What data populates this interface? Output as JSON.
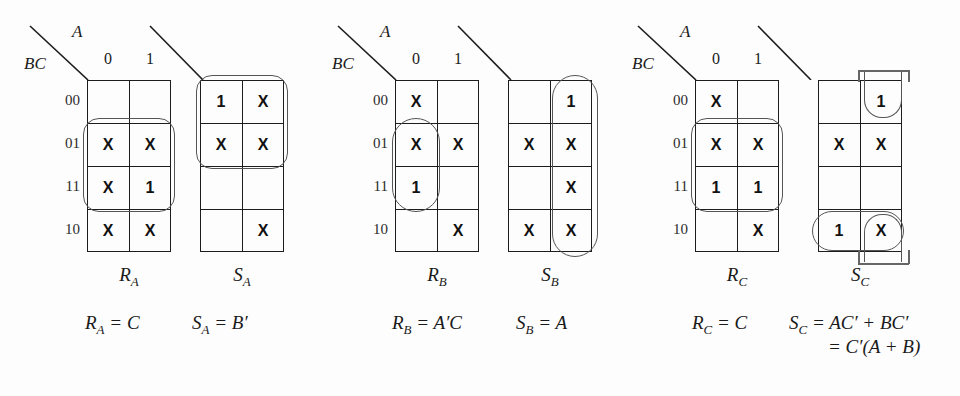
{
  "figure": {
    "background_color": "#fdfdfd",
    "line_color": "#1d1d1d",
    "group_color": "#555555"
  },
  "axis": {
    "col_var": "A",
    "row_var": "BC",
    "col_labels": [
      "0",
      "1"
    ],
    "row_labels": [
      "00",
      "01",
      "11",
      "10"
    ]
  },
  "maps": [
    {
      "id": "RA",
      "name": "R",
      "subscript": "A",
      "cells": [
        [
          "",
          ""
        ],
        [
          "X",
          "X"
        ],
        [
          "X",
          "1"
        ],
        [
          "X",
          "X"
        ]
      ],
      "groups": [
        {
          "kind": "oval",
          "rows": [
            1,
            2
          ],
          "cols": [
            0,
            1
          ]
        }
      ]
    },
    {
      "id": "SA",
      "name": "S",
      "subscript": "A",
      "cells": [
        [
          "1",
          "X"
        ],
        [
          "X",
          "X"
        ],
        [
          "",
          ""
        ],
        [
          "",
          "X"
        ]
      ],
      "groups": [
        {
          "kind": "oval",
          "rows": [
            0,
            1
          ],
          "cols": [
            0,
            1
          ]
        }
      ]
    },
    {
      "id": "RB",
      "name": "R",
      "subscript": "B",
      "cells": [
        [
          "X",
          ""
        ],
        [
          "X",
          "X"
        ],
        [
          "1",
          ""
        ],
        [
          "",
          "X"
        ]
      ],
      "groups": [
        {
          "kind": "oval",
          "rows": [
            1,
            2
          ],
          "cols": [
            0,
            0
          ]
        }
      ]
    },
    {
      "id": "SB",
      "name": "S",
      "subscript": "B",
      "cells": [
        [
          "",
          "1"
        ],
        [
          "X",
          "X"
        ],
        [
          "",
          "X"
        ],
        [
          "X",
          "X"
        ]
      ],
      "groups": [
        {
          "kind": "oval",
          "rows": [
            0,
            3
          ],
          "cols": [
            1,
            1
          ]
        }
      ]
    },
    {
      "id": "RC",
      "name": "R",
      "subscript": "C",
      "cells": [
        [
          "X",
          ""
        ],
        [
          "X",
          "X"
        ],
        [
          "1",
          "1"
        ],
        [
          "",
          "X"
        ]
      ],
      "groups": [
        {
          "kind": "oval",
          "rows": [
            1,
            2
          ],
          "cols": [
            0,
            1
          ]
        }
      ]
    },
    {
      "id": "SC",
      "name": "S",
      "subscript": "C",
      "cells": [
        [
          "",
          "1"
        ],
        [
          "X",
          "X"
        ],
        [
          "",
          ""
        ],
        [
          "1",
          "X"
        ]
      ],
      "groups": [
        {
          "kind": "wrap-vertical",
          "col": 1,
          "rows": [
            0,
            3
          ]
        },
        {
          "kind": "oval",
          "rows": [
            3,
            3
          ],
          "cols": [
            0,
            1
          ]
        }
      ]
    }
  ],
  "equations": [
    {
      "id": "eq-ra",
      "text": "R",
      "sub": "A",
      "rhs": "= C"
    },
    {
      "id": "eq-sa",
      "text": "S",
      "sub": "A",
      "rhs": "= B′"
    },
    {
      "id": "eq-rb",
      "text": "R",
      "sub": "B",
      "rhs": "= A′C"
    },
    {
      "id": "eq-sb",
      "text": "S",
      "sub": "B",
      "rhs": "= A"
    },
    {
      "id": "eq-rc",
      "text": "R",
      "sub": "C",
      "rhs": "= C"
    },
    {
      "id": "eq-sc",
      "text": "S",
      "sub": "C",
      "rhs": "= AC′ + BC′"
    }
  ],
  "equation_continuation": {
    "id": "eq-sc-line2",
    "text": "= C′(A + B)"
  }
}
